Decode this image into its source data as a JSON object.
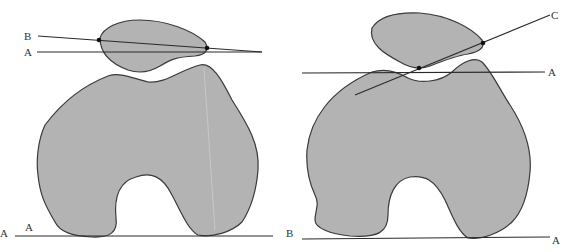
{
  "figure_left": {
    "labels": {
      "line_b": "B",
      "line_a_upper": "A",
      "baseline_a_outer": "A",
      "baseline_a_inner": "A"
    }
  },
  "figure_right": {
    "labels": {
      "line_c": "C",
      "line_a_upper": "A",
      "baseline_b": "B",
      "baseline_a": "A"
    }
  },
  "colors": {
    "bone_fill": "#b3b3b3",
    "outline": "#3a3a3a",
    "background": "#ffffff"
  }
}
